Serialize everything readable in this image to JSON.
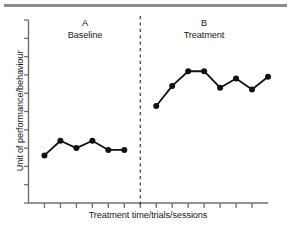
{
  "figure": {
    "top_rule_color": "#8d8d8d",
    "background": "#ffffff",
    "ink_color": "#111111"
  },
  "axes": {
    "y_title": "Unit of performance/behaviour",
    "x_title": "Treatment time/trials/sessions",
    "y_tick_count": 10,
    "x_tick_count": 14,
    "tick_labels_shown": false
  },
  "phases": [
    {
      "letter": "A",
      "name": "Baseline"
    },
    {
      "letter": "B",
      "name": "Treatment"
    }
  ],
  "divider": {
    "style": "dashed",
    "x_position": 136
  },
  "chart_data": {
    "type": "line",
    "title": "",
    "subtitle": "",
    "xlabel": "Treatment time/trials/sessions",
    "ylabel": "Unit of performance/behaviour",
    "xlim": [
      0,
      15
    ],
    "ylim": [
      0,
      10
    ],
    "grid": false,
    "legend": null,
    "axis_tick_labels": {
      "x": [],
      "y": []
    },
    "annotations": [
      {
        "text": "A",
        "x": 3.5,
        "y": 9.6
      },
      {
        "text": "Baseline",
        "x": 3.5,
        "y": 9.0
      },
      {
        "text": "B",
        "x": 11.0,
        "y": 9.6
      },
      {
        "text": "Treatment",
        "x": 11.0,
        "y": 9.0
      },
      {
        "text": "phase-divider",
        "x": 7.0,
        "y": null
      }
    ],
    "phase_divider_x": 7.0,
    "marker": "filled-circle",
    "series": [
      {
        "name": "A Baseline",
        "phase": "A",
        "x": [
          1,
          2,
          3,
          4,
          5,
          6
        ],
        "y": [
          2.6,
          3.4,
          3.0,
          3.4,
          2.9,
          2.9
        ]
      },
      {
        "name": "B Treatment",
        "phase": "B",
        "x": [
          8,
          9,
          10,
          11,
          12,
          13,
          14,
          15
        ],
        "y": [
          5.3,
          6.4,
          7.2,
          7.2,
          6.3,
          6.8,
          6.2,
          6.9
        ]
      }
    ]
  }
}
